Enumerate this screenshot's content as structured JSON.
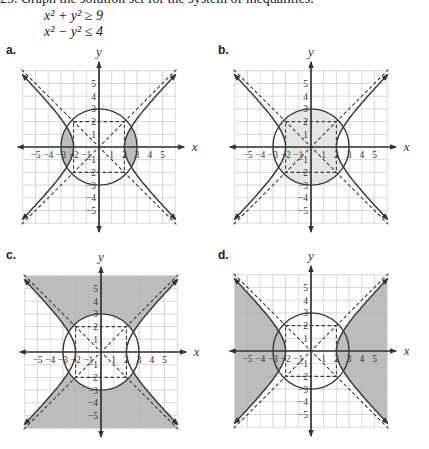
{
  "problem": {
    "header": "25. Graph the solution set for the system of inequalities.",
    "inequalities": [
      "x² + y² ≥ 9",
      "x² − y² ≤ 4"
    ]
  },
  "colors": {
    "grid": "#d9d9d9",
    "axis": "#333333",
    "curve": "#3a3a3a",
    "shade_dark": "#bdbdbd",
    "shade_light": "#e6e6e6"
  },
  "chart_data": [
    {
      "type": "region-plot",
      "label": "a.",
      "xlabel": "x",
      "ylabel": "y",
      "xlim": [
        -6,
        6
      ],
      "ylim": [
        -6,
        6
      ],
      "grid": true,
      "xticks": [
        "−5",
        "−4",
        "−3",
        "−2",
        "−1",
        "1",
        "2",
        "3",
        "4",
        "5"
      ],
      "yticks": [
        "5",
        "4",
        "3",
        "2",
        "1",
        "−1",
        "−2",
        "−3",
        "−4",
        "−5"
      ],
      "curves": [
        {
          "name": "circle",
          "equation": "x² + y² = 9",
          "radius": 3,
          "style": "solid"
        },
        {
          "name": "hyperbola",
          "equation": "x² − y² = 4",
          "a": 2,
          "style": "solid"
        },
        {
          "name": "asymptotes",
          "equation": "y = ±x",
          "style": "dashed"
        },
        {
          "name": "fundamental-rectangle",
          "corners": [
            [
              -2,
              -2
            ],
            [
              2,
              2
            ]
          ],
          "style": "dashed"
        }
      ],
      "shaded_region": "inside circle and outside hyperbola branches (two lens regions near x = ±2 to ±3)",
      "shade": "dark"
    },
    {
      "type": "region-plot",
      "label": "b.",
      "xlabel": "x",
      "ylabel": "y",
      "xlim": [
        -6,
        6
      ],
      "ylim": [
        -6,
        6
      ],
      "grid": true,
      "xticks": [
        "−5",
        "−4",
        "−3",
        "−2",
        "−1",
        "1",
        "2",
        "3",
        "4",
        "5"
      ],
      "yticks": [
        "5",
        "4",
        "3",
        "2",
        "1",
        "−1",
        "−2",
        "−3",
        "−4",
        "−5"
      ],
      "curves": [
        {
          "name": "circle",
          "equation": "x² + y² = 9",
          "radius": 3,
          "style": "solid"
        },
        {
          "name": "hyperbola",
          "equation": "x² − y² = 4",
          "a": 2,
          "style": "solid"
        },
        {
          "name": "asymptotes",
          "equation": "y = ±x",
          "style": "dashed"
        },
        {
          "name": "fundamental-rectangle",
          "corners": [
            [
              -2,
              -2
            ],
            [
              2,
              2
            ]
          ],
          "style": "dashed"
        }
      ],
      "shaded_region": "inside circle and between hyperbola branches",
      "shade": "light"
    },
    {
      "type": "region-plot",
      "label": "c.",
      "xlabel": "x",
      "ylabel": "y",
      "xlim": [
        -6,
        6
      ],
      "ylim": [
        -6,
        6
      ],
      "grid": true,
      "xticks": [
        "−5",
        "−4",
        "−3",
        "−2",
        "−1",
        "1",
        "2",
        "3",
        "4",
        "5"
      ],
      "yticks": [
        "5",
        "4",
        "3",
        "2",
        "1",
        "−1",
        "−2",
        "−3",
        "−4",
        "−5"
      ],
      "curves": [
        {
          "name": "circle",
          "equation": "x² + y² = 9",
          "radius": 3,
          "style": "solid"
        },
        {
          "name": "hyperbola",
          "equation": "x² − y² = 4",
          "a": 2,
          "style": "solid"
        },
        {
          "name": "asymptotes",
          "equation": "y = ±x",
          "style": "dashed"
        },
        {
          "name": "fundamental-rectangle",
          "corners": [
            [
              -2,
              -2
            ],
            [
              2,
              2
            ]
          ],
          "style": "dashed"
        }
      ],
      "shaded_region": "outside circle and between hyperbola branches (top and bottom)",
      "shade": "dark"
    },
    {
      "type": "region-plot",
      "label": "d.",
      "xlabel": "x",
      "ylabel": "y",
      "xlim": [
        -6,
        6
      ],
      "ylim": [
        -6,
        6
      ],
      "grid": true,
      "xticks": [
        "−5",
        "−4",
        "−3",
        "−2",
        "−1",
        "1",
        "2",
        "3",
        "4",
        "5"
      ],
      "yticks": [
        "5",
        "4",
        "3",
        "2",
        "1",
        "−1",
        "−2",
        "−3",
        "−4",
        "−5"
      ],
      "curves": [
        {
          "name": "circle",
          "equation": "x² + y² = 9",
          "radius": 3,
          "style": "solid"
        },
        {
          "name": "hyperbola",
          "equation": "x² − y² = 4",
          "a": 2,
          "style": "solid"
        },
        {
          "name": "asymptotes",
          "equation": "y = ±x",
          "style": "dashed"
        },
        {
          "name": "fundamental-rectangle",
          "corners": [
            [
              -2,
              -2
            ],
            [
              2,
              2
            ]
          ],
          "style": "dashed"
        }
      ],
      "shaded_region": "outside hyperbola branches (left and right)",
      "shade": "dark"
    }
  ]
}
